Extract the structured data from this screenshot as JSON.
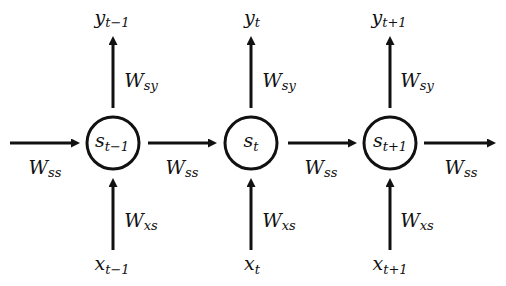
{
  "diagram": {
    "type": "unrolled-recurrent-neural-network",
    "nodes": [
      {
        "state": {
          "base": "s",
          "sub": "t−1"
        },
        "output": {
          "base": "y",
          "sub": "t−1"
        },
        "input": {
          "base": "x",
          "sub": "t−1"
        },
        "w_out": {
          "base": "W",
          "sub": "sy"
        },
        "w_in": {
          "base": "W",
          "sub": "xs"
        }
      },
      {
        "state": {
          "base": "s",
          "sub": "t"
        },
        "output": {
          "base": "y",
          "sub": "t"
        },
        "input": {
          "base": "x",
          "sub": "t"
        },
        "w_out": {
          "base": "W",
          "sub": "sy"
        },
        "w_in": {
          "base": "W",
          "sub": "xs"
        }
      },
      {
        "state": {
          "base": "s",
          "sub": "t+1"
        },
        "output": {
          "base": "y",
          "sub": "t+1"
        },
        "input": {
          "base": "x",
          "sub": "t+1"
        },
        "w_out": {
          "base": "W",
          "sub": "sy"
        },
        "w_in": {
          "base": "W",
          "sub": "xs"
        }
      }
    ],
    "recurrent_weights": [
      {
        "base": "W",
        "sub": "ss"
      },
      {
        "base": "W",
        "sub": "ss"
      },
      {
        "base": "W",
        "sub": "ss"
      },
      {
        "base": "W",
        "sub": "ss"
      }
    ]
  },
  "colors": {
    "stroke": "#111111",
    "background": "#ffffff"
  }
}
